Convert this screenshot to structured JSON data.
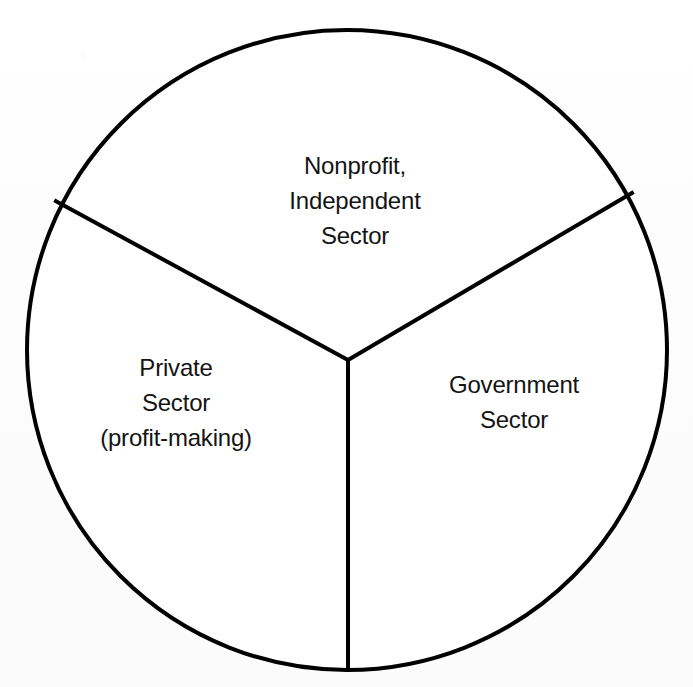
{
  "figure": {
    "kind": "pie-diagram",
    "background_color": "#fdfdfd",
    "stroke_color": "#000000"
  },
  "chart_data": {
    "type": "pie",
    "title": "",
    "subtitle": "",
    "xlabel": "",
    "ylabel": "",
    "legend_position": "none",
    "grid": false,
    "labels_inside_slices": true,
    "geometry": {
      "center_x": 347,
      "center_y": 350,
      "radius": 320,
      "stroke_width": 4,
      "start_angle_deg": 180,
      "direction": "clockwise"
    },
    "categories": [
      "Nonprofit, Independent Sector",
      "Government Sector",
      "Private Sector (profit-making)"
    ],
    "values": [
      33.3,
      33.3,
      33.3
    ],
    "slices": [
      {
        "name": "nonprofit-independent-sector",
        "value": 33.3,
        "unit": "%",
        "fill": "#ffffff",
        "stroke": "#000000",
        "start_angle_deg": 208,
        "end_angle_deg": 332,
        "label_lines": [
          "Nonprofit,",
          "Independent",
          "Sector"
        ],
        "label_center_x": 355,
        "label_center_y": 200
      },
      {
        "name": "government-sector",
        "value": 33.3,
        "unit": "%",
        "fill": "#ffffff",
        "stroke": "#000000",
        "start_angle_deg": 332,
        "end_angle_deg": 90,
        "label_lines": [
          "Government",
          "Sector"
        ],
        "label_center_x": 514,
        "label_center_y": 402
      },
      {
        "name": "private-sector",
        "value": 33.3,
        "unit": "%",
        "fill": "#ffffff",
        "stroke": "#000000",
        "start_angle_deg": 90,
        "end_angle_deg": 208,
        "label_lines": [
          "Private",
          "Sector",
          "(profit-making)"
        ],
        "label_center_x": 176,
        "label_center_y": 402
      }
    ],
    "divider_lines": [
      {
        "name": "divider-bottom",
        "from_x": 348,
        "from_y": 360,
        "to_x": 348,
        "to_y": 662
      },
      {
        "name": "divider-upper-left",
        "from_x": 348,
        "from_y": 360,
        "to_x": 63,
        "to_y": 205
      },
      {
        "name": "divider-upper-right",
        "from_x": 348,
        "from_y": 360,
        "to_x": 625,
        "to_y": 197
      }
    ]
  },
  "labels": {
    "nonprofit": {
      "line1": "Nonprofit,",
      "line2": "Independent",
      "line3": "Sector"
    },
    "private": {
      "line1": "Private",
      "line2": "Sector",
      "line3": "(profit-making)"
    },
    "government": {
      "line1": "Government",
      "line2": "Sector"
    }
  }
}
